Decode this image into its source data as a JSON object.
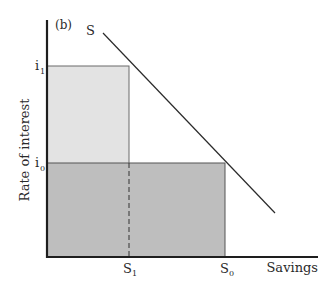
{
  "figure": {
    "panel_label": "(b)",
    "y_axis_label": "Rate of interest",
    "x_axis_label": "Savings",
    "curve_label": "S",
    "y_ticks": [
      {
        "label": "i",
        "sub": "1"
      },
      {
        "label": "i",
        "sub": "0"
      }
    ],
    "x_ticks": [
      {
        "label": "S",
        "sub": "1"
      },
      {
        "label": "S",
        "sub": "0"
      }
    ]
  },
  "colors": {
    "axis": "#1e1e1e",
    "light_fill": "#e2e2e2",
    "dark_fill": "#bdbdbd",
    "line": "#2a2a2a"
  }
}
